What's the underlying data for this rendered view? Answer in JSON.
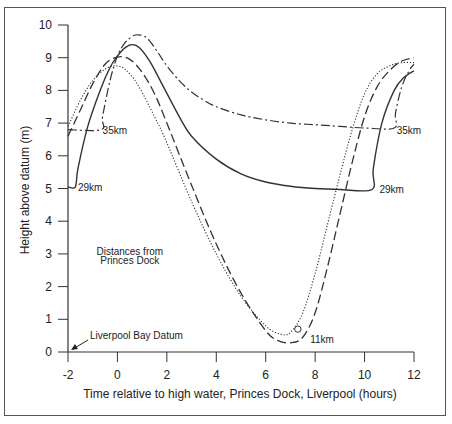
{
  "chart_data": {
    "type": "line",
    "title": "",
    "xlabel": "Time relative to high water, Princes Dock, Liverpool (hours)",
    "ylabel": "Height above datum (m)",
    "xlim": [
      -2,
      12
    ],
    "ylim": [
      0,
      10
    ],
    "xticks": [
      -2,
      0,
      2,
      4,
      6,
      8,
      10,
      12
    ],
    "yticks": [
      0,
      1,
      2,
      3,
      4,
      5,
      6,
      7,
      8,
      9,
      10
    ],
    "grid": false,
    "annotations": [
      {
        "text": "Liverpool Bay Datum",
        "x": -2,
        "y": 0,
        "arrow": true
      },
      {
        "text": "Distances from",
        "x": 0.5,
        "y": 3.1
      },
      {
        "text": "Princes Dock",
        "x": 0.5,
        "y": 2.8
      },
      {
        "text": "35km",
        "x": -0.6,
        "y": 6.8
      },
      {
        "text": "29km",
        "x": -1.6,
        "y": 5.05
      },
      {
        "text": "35km",
        "x": 11.3,
        "y": 6.8
      },
      {
        "text": "29km",
        "x": 10.6,
        "y": 4.98
      },
      {
        "text": "11km",
        "x": 7.8,
        "y": 0.4
      }
    ],
    "series": [
      {
        "name": "35km",
        "style": "dash-dot",
        "x": [
          -2,
          -0.65,
          -0.6,
          -0.3,
          0,
          0.3,
          0.6,
          0.85,
          1.2,
          1.6,
          2,
          2.5,
          3,
          3.5,
          4,
          5,
          6,
          7,
          8,
          9,
          10,
          11.2,
          11.25,
          11.5,
          11.8,
          12
        ],
        "y": [
          6.8,
          6.8,
          7.2,
          8.3,
          9.05,
          9.45,
          9.65,
          9.7,
          9.6,
          9.2,
          8.75,
          8.3,
          7.95,
          7.7,
          7.5,
          7.25,
          7.1,
          7.0,
          6.95,
          6.9,
          6.85,
          6.85,
          7.3,
          8.1,
          8.6,
          8.8
        ]
      },
      {
        "name": "29km",
        "style": "solid",
        "x": [
          -2,
          -1.7,
          -1.6,
          -1.2,
          -0.7,
          -0.3,
          0,
          0.3,
          0.6,
          0.9,
          1.3,
          1.8,
          2.5,
          3,
          4,
          5,
          6,
          7,
          8,
          9,
          10.3,
          10.35,
          10.7,
          11.2,
          11.6,
          12
        ],
        "y": [
          5.05,
          5.05,
          5.6,
          6.9,
          8.0,
          8.7,
          9.05,
          9.3,
          9.4,
          9.3,
          8.9,
          8.2,
          7.2,
          6.6,
          5.9,
          5.45,
          5.2,
          5.07,
          5.0,
          4.97,
          4.97,
          5.6,
          7.0,
          8.0,
          8.4,
          8.6
        ]
      },
      {
        "name": "11km",
        "style": "dashed",
        "x": [
          -2,
          -1.5,
          -1,
          -0.5,
          0,
          0.5,
          1,
          1.5,
          2,
          3,
          4,
          5,
          6,
          6.5,
          7,
          7.5,
          8,
          8.5,
          9,
          9.5,
          10,
          10.5,
          11,
          11.5,
          12
        ],
        "y": [
          6.6,
          7.4,
          8.2,
          8.8,
          9.02,
          8.95,
          8.55,
          7.9,
          7.0,
          5.1,
          3.3,
          1.8,
          0.65,
          0.35,
          0.28,
          0.45,
          1.2,
          2.6,
          4.2,
          5.8,
          7.2,
          8.1,
          8.6,
          8.9,
          9.0
        ]
      },
      {
        "name": "dotted",
        "style": "dotted",
        "x": [
          -2,
          -1.5,
          -1,
          -0.5,
          -0.1,
          0.3,
          0.8,
          1.5,
          2,
          3,
          4,
          5,
          6,
          6.6,
          7,
          7.5,
          8,
          8.5,
          9,
          9.5,
          10,
          10.5,
          11,
          11.5,
          12
        ],
        "y": [
          6.9,
          7.7,
          8.3,
          8.65,
          8.75,
          8.65,
          8.2,
          7.2,
          6.4,
          4.6,
          3.0,
          1.7,
          0.8,
          0.55,
          0.6,
          1.2,
          2.4,
          3.9,
          5.4,
          6.8,
          7.9,
          8.5,
          8.75,
          8.85,
          8.85
        ]
      }
    ],
    "marker": {
      "type": "circle",
      "x": 7.3,
      "y": 0.7
    }
  }
}
